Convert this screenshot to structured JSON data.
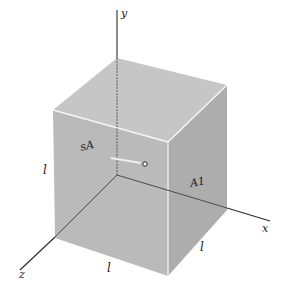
{
  "diagram": {
    "type": "3d-cube-coordinate-axes",
    "axes": {
      "x_label": "x",
      "y_label": "y",
      "z_label": "z"
    },
    "edge_labels": {
      "left_vertical": "l",
      "front_bottom": "l",
      "right_bottom": "l"
    },
    "face_labels": {
      "front": " sA",
      "right": "A1"
    },
    "center_marker": "o",
    "colors": {
      "cube_front": "#b9b9b9",
      "cube_top": "#c4c4c4",
      "cube_right": "#acacac",
      "edge_highlight": "#f4f4f4",
      "axis": "#2a2a2a",
      "background": "#ffffff"
    }
  }
}
